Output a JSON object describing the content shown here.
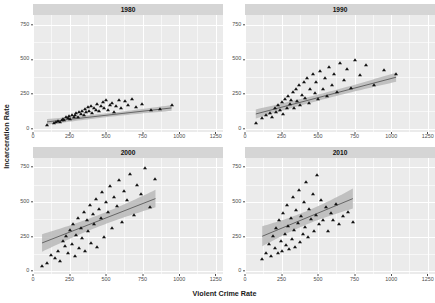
{
  "chart_data": {
    "type": "scatter",
    "title": "",
    "xlabel": "Violent Crime Rate",
    "ylabel": "Incarceration Rate",
    "xlim": [
      0,
      1300
    ],
    "ylim": [
      -20,
      820
    ],
    "xticks": [
      0,
      250,
      500,
      750,
      1000,
      1250
    ],
    "yticks": [
      0,
      250,
      500,
      750
    ],
    "xtick_labels": [
      "0",
      "250",
      "500",
      "750",
      "1000",
      "1250"
    ],
    "ytick_labels": [
      "0",
      "250",
      "500",
      "750"
    ],
    "grid": true,
    "legend": "none",
    "marker": "triangle",
    "marker_color": "#111111",
    "line_color": "#555555",
    "ribbon_color": "#b4b4b4",
    "panel_background": "#ebebeb",
    "grid_color": "#ffffff",
    "strip_background": "#d5d5d5",
    "facet_variable": "year",
    "facets": [
      {
        "label": "1980",
        "fit": {
          "intercept": 38,
          "slope": 0.118,
          "se": 14
        },
        "x": [
          96,
          141,
          158,
          171,
          186,
          196,
          206,
          214,
          226,
          238,
          247,
          256,
          268,
          279,
          289,
          297,
          308,
          316,
          327,
          338,
          347,
          356,
          366,
          374,
          385,
          396,
          406,
          417,
          428,
          438,
          451,
          463,
          476,
          489,
          502,
          514,
          527,
          541,
          556,
          571,
          586,
          604,
          628,
          652,
          676,
          704,
          744,
          808,
          872,
          948
        ],
        "y": [
          24,
          41,
          52,
          58,
          47,
          66,
          72,
          61,
          84,
          74,
          92,
          68,
          101,
          88,
          96,
          112,
          85,
          122,
          106,
          131,
          99,
          143,
          118,
          156,
          128,
          167,
          111,
          148,
          138,
          178,
          125,
          162,
          195,
          151,
          206,
          134,
          172,
          188,
          121,
          165,
          208,
          146,
          199,
          174,
          213,
          158,
          181,
          136,
          142,
          172
        ]
      },
      {
        "label": "1990",
        "fit": {
          "intercept": 86,
          "slope": 0.276,
          "se": 22
        },
        "x": [
          74,
          118,
          146,
          172,
          188,
          202,
          214,
          228,
          241,
          253,
          262,
          274,
          286,
          296,
          308,
          318,
          327,
          336,
          346,
          357,
          368,
          378,
          389,
          401,
          412,
          424,
          436,
          448,
          462,
          476,
          488,
          502,
          516,
          531,
          546,
          562,
          578,
          594,
          612,
          632,
          652,
          674,
          698,
          724,
          752,
          786,
          828,
          886,
          952,
          1034
        ],
        "y": [
          41,
          78,
          96,
          112,
          88,
          146,
          124,
          168,
          136,
          192,
          108,
          214,
          152,
          238,
          176,
          204,
          262,
          148,
          286,
          198,
          312,
          168,
          244,
          338,
          222,
          364,
          186,
          288,
          396,
          258,
          334,
          212,
          418,
          286,
          368,
          238,
          444,
          312,
          398,
          264,
          472,
          352,
          428,
          296,
          494,
          386,
          458,
          318,
          426,
          392
        ]
      },
      {
        "label": "2000",
        "fit": {
          "intercept": 182,
          "slope": 0.412,
          "se": 42
        },
        "x": [
          62,
          96,
          124,
          148,
          168,
          186,
          202,
          216,
          228,
          242,
          254,
          264,
          276,
          286,
          296,
          306,
          316,
          326,
          336,
          346,
          356,
          368,
          378,
          388,
          398,
          408,
          418,
          428,
          438,
          450,
          462,
          474,
          486,
          498,
          512,
          526,
          542,
          556,
          572,
          588,
          606,
          624,
          644,
          664,
          688,
          712,
          738,
          766,
          798,
          838
        ],
        "y": [
          36,
          62,
          118,
          96,
          148,
          74,
          216,
          182,
          256,
          132,
          296,
          198,
          342,
          108,
          264,
          386,
          168,
          312,
          236,
          428,
          146,
          366,
          288,
          476,
          202,
          412,
          338,
          524,
          178,
          452,
          386,
          568,
          248,
          496,
          428,
          612,
          312,
          538,
          468,
          656,
          358,
          582,
          512,
          698,
          406,
          624,
          556,
          742,
          462,
          668
        ]
      },
      {
        "label": "2010",
        "fit": {
          "intercept": 204,
          "slope": 0.438,
          "se": 48
        },
        "x": [
          118,
          142,
          162,
          178,
          192,
          204,
          214,
          226,
          236,
          246,
          254,
          262,
          272,
          280,
          288,
          296,
          304,
          312,
          320,
          328,
          336,
          344,
          352,
          360,
          368,
          376,
          386,
          394,
          402,
          412,
          420,
          430,
          440,
          450,
          462,
          472,
          484,
          496,
          508,
          522,
          536,
          552,
          568,
          586,
          604,
          624,
          646,
          672,
          702,
          738
        ],
        "y": [
          86,
          132,
          198,
          108,
          256,
          164,
          312,
          128,
          368,
          218,
          144,
          422,
          272,
          186,
          478,
          324,
          158,
          386,
          232,
          532,
          296,
          176,
          442,
          348,
          588,
          212,
          398,
          268,
          502,
          322,
          642,
          248,
          452,
          376,
          558,
          292,
          408,
          692,
          338,
          512,
          368,
          462,
          288,
          418,
          372,
          486,
          342,
          398,
          428,
          356
        ]
      }
    ]
  }
}
